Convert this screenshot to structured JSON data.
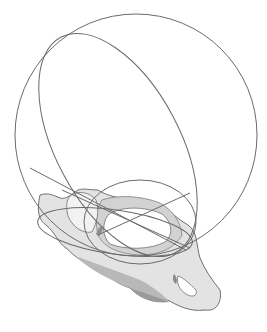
{
  "figure": {
    "background": "#ffffff",
    "colors": {
      "line": "#6a6a6a",
      "bone_light": "#e6e6e6",
      "bone_mid": "#cfcfcf",
      "bone_dark": "#9a9a9a",
      "bone_outline": "#707070"
    },
    "elements": [
      {
        "name": "large-sphere-outline",
        "type": "circle"
      },
      {
        "name": "tilted-ellipse-plane",
        "type": "ellipse"
      },
      {
        "name": "small-inlet-circle",
        "type": "circle"
      },
      {
        "name": "pelvis-bone",
        "type": "shape"
      },
      {
        "name": "cross-axis-lines",
        "type": "lines"
      }
    ]
  }
}
